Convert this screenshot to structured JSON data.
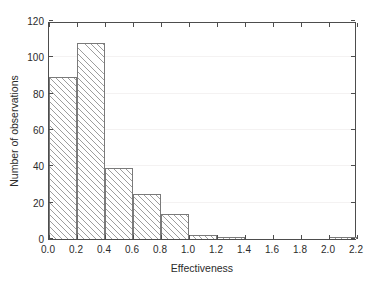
{
  "chart_data": {
    "type": "bar",
    "title": "",
    "subtitle": "",
    "xlabel": "Effectiveness",
    "ylabel": "Number of observations",
    "xlim": [
      0.0,
      2.2
    ],
    "ylim": [
      0,
      120
    ],
    "grid": true,
    "legend": null,
    "legend_position": "none",
    "bin_width": 0.2,
    "bin_edges": [
      0.0,
      0.2,
      0.4,
      0.6,
      0.8,
      1.0,
      1.2,
      1.4,
      1.6,
      1.8,
      2.0,
      2.2
    ],
    "categories": [
      "0.0-0.2",
      "0.2-0.4",
      "0.4-0.6",
      "0.6-0.8",
      "0.8-1.0",
      "1.0-1.2",
      "1.2-1.4",
      "1.4-1.6",
      "1.6-1.8",
      "1.8-2.0",
      "2.0-2.2"
    ],
    "values": [
      89,
      108,
      39,
      25,
      14,
      2,
      1,
      0,
      0,
      0,
      1
    ],
    "xticks": [
      0.0,
      0.2,
      0.4,
      0.6,
      0.8,
      1.0,
      1.2,
      1.4,
      1.6,
      1.8,
      2.0,
      2.2
    ],
    "xticklabels": [
      "0.0",
      "0.2",
      "0.4",
      "0.6",
      "0.8",
      "1.0",
      "1.2",
      "1.4",
      "1.6",
      "1.8",
      "2.0",
      "2.2"
    ],
    "yticks": [
      0,
      20,
      40,
      60,
      80,
      100,
      120
    ],
    "yticklabels": [
      "0",
      "20",
      "40",
      "60",
      "80",
      "100",
      "120"
    ],
    "colors": {
      "bar_edge": "#7a7a7a",
      "bar_fill": "#ffffff",
      "hatch": "#8c8c8c",
      "hatch_pattern": "/",
      "axis": "#4d4d4d",
      "gridline": "#f4f2f2",
      "text": "#2b2b2b",
      "background": "#ffffff"
    }
  }
}
